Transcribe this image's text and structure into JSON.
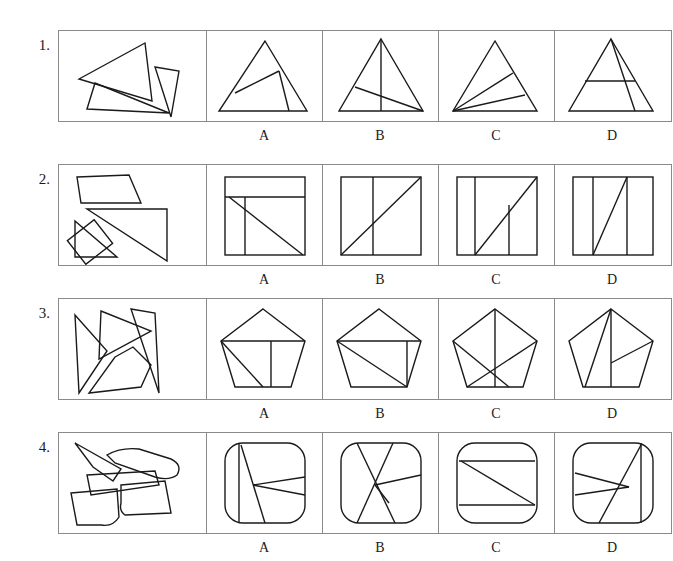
{
  "sheet": {
    "title": "Shape dissection multiple-choice worksheet",
    "row_count": 4,
    "options_per_row": 4,
    "ink_color": "#1a1a1a",
    "border_color": "#8a8a8a",
    "background_color": "#ffffff"
  },
  "option_letters": [
    "A",
    "B",
    "C",
    "D"
  ],
  "rows": [
    {
      "number": "1.",
      "prompt_name": "scattered-triangle-pieces",
      "target_shape": "triangle",
      "options": [
        {
          "letter": "A",
          "shape": "triangle",
          "cut_description": "triangle with two internal cuts meeting mid-left"
        },
        {
          "letter": "B",
          "shape": "triangle",
          "cut_description": "tall triangle with vertical median and slanted chord"
        },
        {
          "letter": "C",
          "shape": "triangle",
          "cut_description": "triangle with two cuts fanning from bottom-left vertex"
        },
        {
          "letter": "D",
          "shape": "triangle",
          "cut_description": "triangle with horizontal cut and slanted cut from apex"
        }
      ]
    },
    {
      "number": "2.",
      "prompt_name": "scattered-square-pieces",
      "target_shape": "square",
      "options": [
        {
          "letter": "A",
          "shape": "square",
          "cut_description": "square with top band, vertical cut and diagonal"
        },
        {
          "letter": "B",
          "shape": "square",
          "cut_description": "square with vertical cut and full diagonal"
        },
        {
          "letter": "C",
          "shape": "square",
          "cut_description": "square with two vertical cuts and diagonal"
        },
        {
          "letter": "D",
          "shape": "square",
          "cut_description": "square with two vertical cuts and steep slanted cut"
        }
      ]
    },
    {
      "number": "3.",
      "prompt_name": "scattered-pentagon-pieces",
      "target_shape": "pentagon",
      "options": [
        {
          "letter": "A",
          "shape": "pentagon",
          "cut_description": "pentagon with horizontal chord, slanted cut and vertical cut"
        },
        {
          "letter": "B",
          "shape": "pentagon",
          "cut_description": "pentagon with fan of cuts from left vertex"
        },
        {
          "letter": "C",
          "shape": "pentagon",
          "cut_description": "pentagon with vertical median and crossing diagonals"
        },
        {
          "letter": "D",
          "shape": "pentagon",
          "cut_description": "pentagon with vertical median and two cuts from apex"
        }
      ]
    },
    {
      "number": "4.",
      "prompt_name": "scattered-rounded-square-pieces",
      "target_shape": "rounded-square",
      "options": [
        {
          "letter": "A",
          "shape": "rounded-square",
          "cut_description": "rounded square with vertical cut and narrow wedge at right"
        },
        {
          "letter": "B",
          "shape": "rounded-square",
          "cut_description": "rounded square with crossing X cuts and side cut"
        },
        {
          "letter": "C",
          "shape": "rounded-square",
          "cut_description": "rounded square with two horizontal cuts and diagonal"
        },
        {
          "letter": "D",
          "shape": "rounded-square",
          "cut_description": "rounded square with vertical cut, diagonal and wedge"
        }
      ]
    }
  ]
}
